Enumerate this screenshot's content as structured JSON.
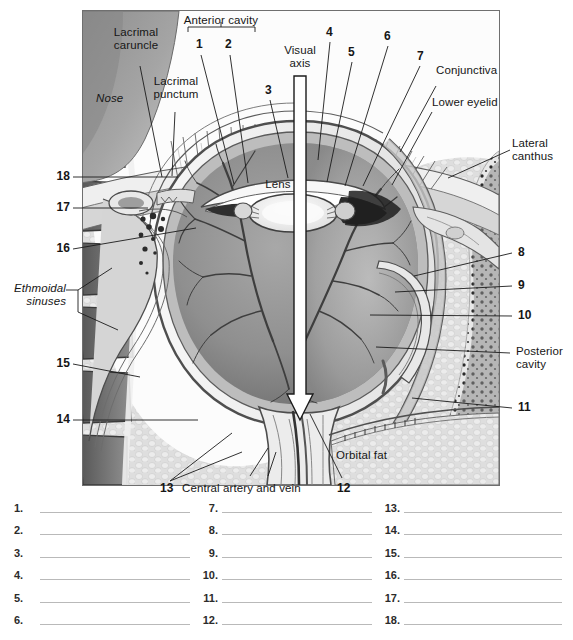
{
  "figure": {
    "title_labels": {
      "anterior_cavity": "Anterior cavity",
      "visual_axis": "Visual\naxis",
      "lacrimal_caruncle": "Lacrimal\ncaruncle",
      "lacrimal_punctum": "Lacrimal\npunctum",
      "nose": "Nose",
      "lens": "Lens",
      "conjunctiva": "Conjunctiva",
      "lower_eyelid": "Lower eyelid",
      "lateral_canthus": "Lateral\ncanthus",
      "ethmoidal_sinuses": "Ethmoidal\nsinuses",
      "posterior_cavity": "Posterior\ncavity",
      "orbital_fat": "Orbital fat",
      "central_artery_and_vein": "Central artery and vein"
    },
    "leader_numbers": {
      "n1": "1",
      "n2": "2",
      "n3": "3",
      "n4": "4",
      "n5": "5",
      "n6": "6",
      "n7": "7",
      "n8": "8",
      "n9": "9",
      "n10": "10",
      "n11": "11",
      "n12": "12",
      "n13": "13",
      "n14": "14",
      "n15": "15",
      "n16": "16",
      "n17": "17",
      "n18": "18"
    },
    "colors": {
      "frame_border": "#6f6f6f",
      "sclera": "#efefef",
      "retina_dark": "#7a7a7a",
      "vitreous": "#9a9a9a",
      "orbital_fat": "#dcdcdc",
      "sinus_dark": "#6b6b6b",
      "nose": "#9c9c9c",
      "lens": "#f2f2f2",
      "iris_dark": "#3a3a3a",
      "vessel": "#4a4a4a",
      "leader_line": "#1b1b1b",
      "blank_line": "#b9b9b9"
    }
  },
  "answer_blanks": {
    "columns": [
      {
        "numbers": [
          "1.",
          "2.",
          "3.",
          "4.",
          "5.",
          "6."
        ]
      },
      {
        "numbers": [
          "7.",
          "8.",
          "9.",
          "10.",
          "11.",
          "12."
        ]
      },
      {
        "numbers": [
          "13.",
          "14.",
          "15.",
          "16.",
          "17.",
          "18."
        ]
      }
    ]
  }
}
